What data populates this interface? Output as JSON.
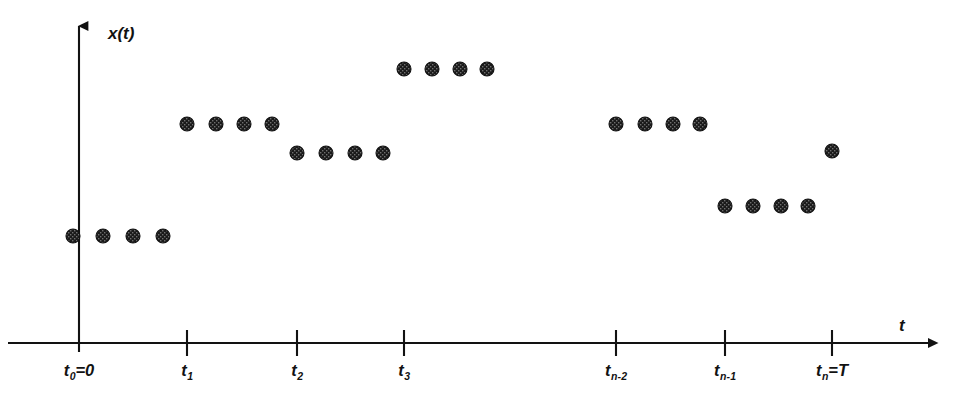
{
  "figure": {
    "width": 953,
    "height": 418,
    "background": "#ffffff",
    "ink_color": "#121212"
  },
  "axes": {
    "y_axis_label": "x(t)",
    "x_axis_label": "t",
    "y_axis_x_px": 79,
    "x_axis_y_px": 343,
    "y_axis_top_px": 15,
    "x_axis_right_px": 940,
    "x_axis_left_px": 8
  },
  "ticks": [
    {
      "name": "t0",
      "base": "t",
      "sub": "0",
      "suffix": "=0",
      "x": 79
    },
    {
      "name": "t1",
      "base": "t",
      "sub": "1",
      "suffix": "",
      "x": 187
    },
    {
      "name": "t2",
      "base": "t",
      "sub": "2",
      "suffix": "",
      "x": 297
    },
    {
      "name": "t3",
      "base": "t",
      "sub": "3",
      "suffix": "",
      "x": 404
    },
    {
      "name": "tn-2",
      "base": "t",
      "sub": "n-2",
      "suffix": "",
      "x": 616
    },
    {
      "name": "tn-1",
      "base": "t",
      "sub": "n-1",
      "suffix": "",
      "x": 725
    },
    {
      "name": "tn",
      "base": "t",
      "sub": "n",
      "suffix": "=T",
      "x": 832
    }
  ],
  "chart_data": {
    "type": "scatter",
    "title": "",
    "xlabel": "t",
    "ylabel": "x(t)",
    "grid": false,
    "legend": null,
    "xlim_px": [
      8,
      940
    ],
    "ylim_px": [
      15,
      343
    ],
    "marker": {
      "shape": "circle",
      "diameter_px": 14,
      "fill": "#1a1a1a",
      "texture": "cross-hatch"
    },
    "tick_labels": [
      "t0=0",
      "t1",
      "t2",
      "t3",
      "tn-2",
      "tn-1",
      "tn=T"
    ],
    "groups": [
      {
        "interval": "t0",
        "level_y_px": 236,
        "points_x_px": [
          73,
          103,
          133,
          163
        ]
      },
      {
        "interval": "t1",
        "level_y_px": 124,
        "points_x_px": [
          187,
          216,
          244,
          272
        ]
      },
      {
        "interval": "t2",
        "level_y_px": 153,
        "points_x_px": [
          297,
          326,
          355,
          383
        ]
      },
      {
        "interval": "t3",
        "level_y_px": 69,
        "points_x_px": [
          404,
          432,
          460,
          487
        ]
      },
      {
        "interval": "tn-2",
        "level_y_px": 124,
        "points_x_px": [
          616,
          645,
          673,
          700
        ]
      },
      {
        "interval": "tn-1",
        "level_y_px": 206,
        "points_x_px": [
          725,
          753,
          781,
          808
        ]
      },
      {
        "interval": "tn",
        "level_y_px": 151,
        "points_x_px": [
          832
        ]
      }
    ]
  }
}
